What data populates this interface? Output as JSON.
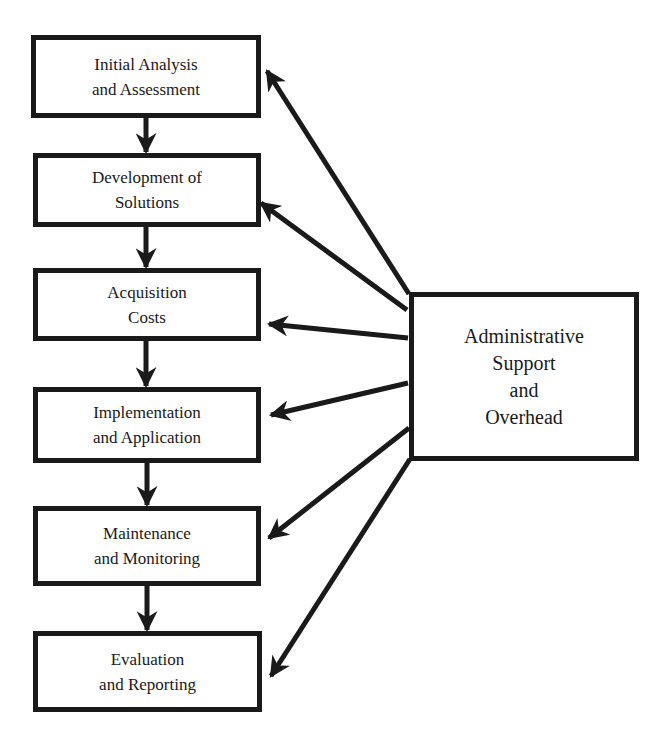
{
  "diagram": {
    "process_steps": [
      {
        "id": "step1",
        "lines": [
          "Initial Analysis",
          "and Assessment"
        ],
        "box": [
          31,
          35,
          230,
          83
        ]
      },
      {
        "id": "step2",
        "lines": [
          "Development of",
          "Solutions"
        ],
        "box": [
          33,
          153,
          228,
          74
        ]
      },
      {
        "id": "step3",
        "lines": [
          "Acquisition",
          "Costs"
        ],
        "box": [
          33,
          268,
          228,
          73
        ]
      },
      {
        "id": "step4",
        "lines": [
          "Implementation",
          "and Application"
        ],
        "box": [
          33,
          387,
          228,
          76
        ]
      },
      {
        "id": "step5",
        "lines": [
          "Maintenance",
          "and Monitoring"
        ],
        "box": [
          33,
          506,
          228,
          80
        ]
      },
      {
        "id": "step6",
        "lines": [
          "Evaluation",
          "and Reporting"
        ],
        "box": [
          33,
          631,
          229,
          81
        ]
      }
    ],
    "support_node": {
      "id": "admin",
      "lines": [
        "Administrative",
        "Support",
        "and",
        "Overhead"
      ],
      "box": [
        409,
        292,
        230,
        169
      ]
    },
    "sequence_arrows": [
      {
        "from": "step1",
        "to": "step2",
        "x": 146,
        "y1": 118,
        "y2": 152
      },
      {
        "from": "step2",
        "to": "step3",
        "x": 146,
        "y1": 227,
        "y2": 267
      },
      {
        "from": "step3",
        "to": "step4",
        "x": 146,
        "y1": 341,
        "y2": 386
      },
      {
        "from": "step4",
        "to": "step5",
        "x": 147,
        "y1": 463,
        "y2": 505
      },
      {
        "from": "step5",
        "to": "step6",
        "x": 147,
        "y1": 586,
        "y2": 630
      }
    ],
    "support_arrows": [
      {
        "from": "admin",
        "to": "step1",
        "x1": 409,
        "y1": 294,
        "x2": 267,
        "y2": 71
      },
      {
        "from": "admin",
        "to": "step2",
        "x1": 407,
        "y1": 310,
        "x2": 261,
        "y2": 203
      },
      {
        "from": "admin",
        "to": "step3",
        "x1": 408,
        "y1": 338,
        "x2": 269,
        "y2": 324
      },
      {
        "from": "admin",
        "to": "step4",
        "x1": 408,
        "y1": 383,
        "x2": 271,
        "y2": 415
      },
      {
        "from": "admin",
        "to": "step5",
        "x1": 409,
        "y1": 428,
        "x2": 269,
        "y2": 538
      },
      {
        "from": "admin",
        "to": "step6",
        "x1": 410,
        "y1": 459,
        "x2": 271,
        "y2": 676
      }
    ],
    "colors": {
      "stroke": "#1a1a1a",
      "background": "#ffffff"
    }
  }
}
